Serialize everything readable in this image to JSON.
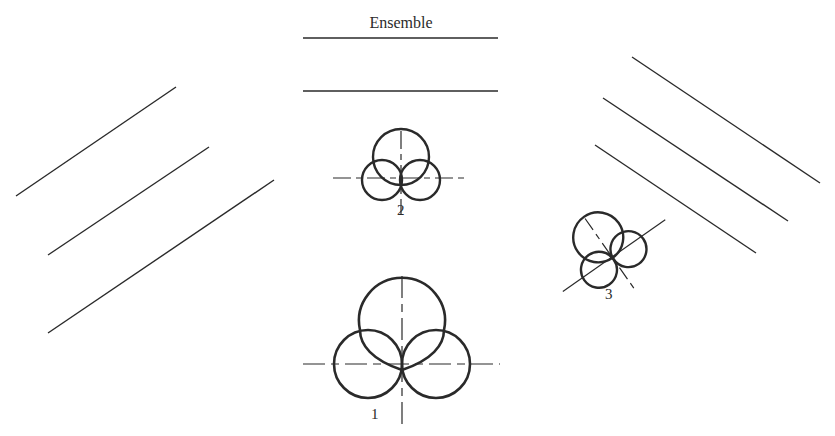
{
  "title": "Ensemble",
  "labels": {
    "diagram_1": "1",
    "diagram_2": "2",
    "diagram_3": "3"
  },
  "colors": {
    "stroke": "#2a2a2a",
    "background": "#ffffff"
  },
  "figure": {
    "ensemble_lines": [
      {
        "x1": 303,
        "y1": 38,
        "x2": 498,
        "y2": 38
      },
      {
        "x1": 303,
        "y1": 91,
        "x2": 498,
        "y2": 91
      }
    ],
    "left_lines": [
      {
        "x1": 16,
        "y1": 196,
        "x2": 176,
        "y2": 87
      },
      {
        "x1": 48,
        "y1": 255,
        "x2": 209,
        "y2": 147
      },
      {
        "x1": 48,
        "y1": 333,
        "x2": 274,
        "y2": 180
      }
    ],
    "right_lines": [
      {
        "x1": 632,
        "y1": 57,
        "x2": 820,
        "y2": 183
      },
      {
        "x1": 603,
        "y1": 98,
        "x2": 788,
        "y2": 221
      },
      {
        "x1": 595,
        "y1": 145,
        "x2": 756,
        "y2": 253
      }
    ]
  }
}
